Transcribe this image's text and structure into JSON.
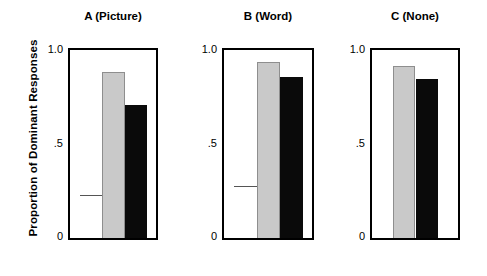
{
  "figure": {
    "ylabel": "Proportion of Dominant Responses",
    "y_ticks": [
      "1.0",
      ".5",
      "0"
    ]
  },
  "panels": [
    {
      "title": "A (Picture)",
      "bars": [
        {
          "name": "open",
          "value": 0.23,
          "style": "open"
        },
        {
          "name": "gray",
          "value": 0.89,
          "style": "gray"
        },
        {
          "name": "black",
          "value": 0.71,
          "style": "black"
        }
      ]
    },
    {
      "title": "B (Word)",
      "bars": [
        {
          "name": "open",
          "value": 0.28,
          "style": "open"
        },
        {
          "name": "gray",
          "value": 0.94,
          "style": "gray"
        },
        {
          "name": "black",
          "value": 0.86,
          "style": "black"
        }
      ]
    },
    {
      "title": "C (None)",
      "bars": [
        {
          "name": "gray",
          "value": 0.92,
          "style": "gray"
        },
        {
          "name": "black",
          "value": 0.85,
          "style": "black"
        }
      ]
    }
  ],
  "chart_data": {
    "type": "bar",
    "title": "",
    "subtitle": "",
    "xlabel": "",
    "ylabel": "Proportion of Dominant Responses",
    "ylim": [
      0,
      1.0
    ],
    "y_ticks": [
      0,
      0.5,
      1.0
    ],
    "y_tick_labels": [
      "0",
      ".5",
      "1.0"
    ],
    "grid": false,
    "legend": null,
    "panels": [
      {
        "panel_label": "A (Picture)",
        "categories": [
          "open",
          "gray",
          "black"
        ],
        "values": [
          0.23,
          0.89,
          0.71
        ]
      },
      {
        "panel_label": "B (Word)",
        "categories": [
          "open",
          "gray",
          "black"
        ],
        "values": [
          0.28,
          0.94,
          0.86
        ]
      },
      {
        "panel_label": "C (None)",
        "categories": [
          "gray",
          "black"
        ],
        "values": [
          0.92,
          0.85
        ]
      }
    ],
    "colors": {
      "open": "#ffffff",
      "gray": "#c9c9c9",
      "black": "#0a0a0a",
      "axis": "#000000"
    }
  },
  "layout": {
    "panel_lefts": [
      68,
      222,
      370
    ],
    "panel_widths": [
      90,
      92,
      90
    ],
    "plot_top": 48,
    "plot_bottom": 240,
    "value_top_y": 50,
    "value_zero_y": 237
  }
}
